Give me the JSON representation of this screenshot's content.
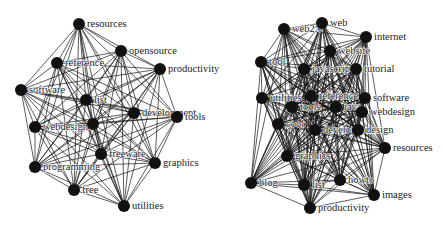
{
  "graphs": [
    {
      "name": "left-network",
      "node_radius": 6,
      "nodes": [
        {
          "id": "resources",
          "label": "resources",
          "x": 79,
          "y": 24
        },
        {
          "id": "opensource",
          "label": "opensource",
          "x": 121,
          "y": 51
        },
        {
          "id": "productivity",
          "label": "productivity",
          "x": 160,
          "y": 69
        },
        {
          "id": "reference",
          "label": "reference",
          "x": 57,
          "y": 63
        },
        {
          "id": "software",
          "label": "software",
          "x": 21,
          "y": 90
        },
        {
          "id": "list",
          "label": "list",
          "x": 86,
          "y": 100
        },
        {
          "id": "development",
          "label": "development",
          "x": 134,
          "y": 113
        },
        {
          "id": "tools",
          "label": "tools",
          "x": 177,
          "y": 117
        },
        {
          "id": "webdesign",
          "label": "webdesign",
          "x": 35,
          "y": 127
        },
        {
          "id": "design",
          "label": "",
          "x": 93,
          "y": 124
        },
        {
          "id": "freeware",
          "label": "freeware",
          "x": 101,
          "y": 154
        },
        {
          "id": "graphics",
          "label": "graphics",
          "x": 155,
          "y": 163
        },
        {
          "id": "programming",
          "label": "programming",
          "x": 35,
          "y": 167
        },
        {
          "id": "free",
          "label": "free",
          "x": 74,
          "y": 190
        },
        {
          "id": "utilities",
          "label": "utilities",
          "x": 124,
          "y": 206
        }
      ]
    },
    {
      "name": "right-network",
      "node_radius": 6,
      "nodes": [
        {
          "id": "web2",
          "label": "web2.0",
          "x": 284,
          "y": 29
        },
        {
          "id": "web",
          "label": "web",
          "x": 322,
          "y": 23
        },
        {
          "id": "internet",
          "label": "internet",
          "x": 366,
          "y": 37
        },
        {
          "id": "website",
          "label": "website",
          "x": 330,
          "y": 51
        },
        {
          "id": "tool",
          "label": "tool",
          "x": 261,
          "y": 62
        },
        {
          "id": "javascript",
          "label": "javascript",
          "x": 304,
          "y": 69
        },
        {
          "id": "tutorial",
          "label": "tutorial",
          "x": 356,
          "y": 69
        },
        {
          "id": "utilities",
          "label": "utilities",
          "x": 262,
          "y": 98
        },
        {
          "id": "reference",
          "label": "reference",
          "x": 311,
          "y": 96
        },
        {
          "id": "java",
          "label": "java",
          "x": 336,
          "y": 107
        },
        {
          "id": "software",
          "label": "software",
          "x": 365,
          "y": 98
        },
        {
          "id": "tools",
          "label": "tools",
          "x": 292,
          "y": 107
        },
        {
          "id": "webdesign",
          "label": "webdesign",
          "x": 362,
          "y": 112
        },
        {
          "id": "cool",
          "label": "cool",
          "x": 278,
          "y": 124
        },
        {
          "id": "development",
          "label": "development",
          "x": 315,
          "y": 130
        },
        {
          "id": "design",
          "label": "design",
          "x": 358,
          "y": 130
        },
        {
          "id": "resources",
          "label": "resources",
          "x": 385,
          "y": 148
        },
        {
          "id": "graphics",
          "label": "graphics",
          "x": 287,
          "y": 156
        },
        {
          "id": "blog",
          "label": "blog",
          "x": 251,
          "y": 183
        },
        {
          "id": "list",
          "label": "list",
          "x": 304,
          "y": 185
        },
        {
          "id": "howto",
          "label": "howto",
          "x": 340,
          "y": 180
        },
        {
          "id": "images",
          "label": "images",
          "x": 374,
          "y": 195
        },
        {
          "id": "productivity",
          "label": "productivity",
          "x": 310,
          "y": 208
        }
      ]
    }
  ]
}
